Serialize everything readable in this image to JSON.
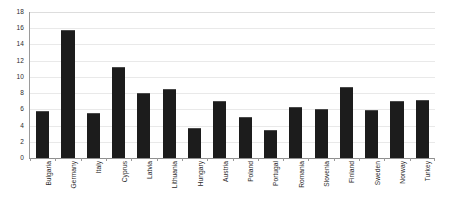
{
  "chart_data": {
    "type": "bar",
    "title": "",
    "subtitle": "",
    "xlabel": "",
    "ylabel": "",
    "ylim": [
      0,
      18
    ],
    "yticks": [
      0,
      2,
      4,
      6,
      8,
      10,
      12,
      14,
      16,
      18
    ],
    "grid": true,
    "legend": false,
    "legend_position": "none",
    "bar_color": "#1c1c1c",
    "categories": [
      "Bulgaria",
      "Germany",
      "Italy",
      "Cyprus",
      "Latvia",
      "Lithuania",
      "Hungary",
      "Austria",
      "Poland",
      "Portugal",
      "Romania",
      "Slovenia",
      "Finland",
      "Sweden",
      "Norway",
      "Turkey"
    ],
    "values": [
      5.8,
      15.8,
      5.5,
      11.2,
      8.0,
      8.5,
      3.7,
      7.0,
      5.1,
      3.5,
      6.3,
      6.0,
      8.8,
      5.9,
      7.0,
      7.2
    ],
    "annotations": []
  }
}
